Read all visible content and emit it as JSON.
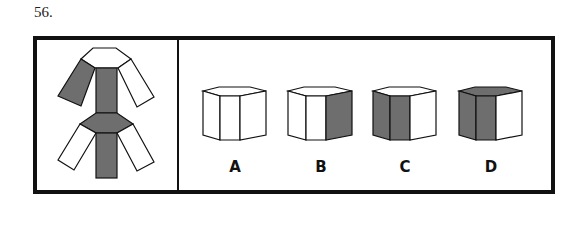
{
  "question": {
    "number": "56."
  },
  "colors": {
    "shaded": "#6e6e6e",
    "line": "#111111",
    "blank": "#ffffff"
  },
  "net": {
    "description": "unfolded hexagonal prism net with shaded faces"
  },
  "options": [
    {
      "label": "A",
      "top": "white",
      "left": "white",
      "mid": "white",
      "right": "white"
    },
    {
      "label": "B",
      "top": "white",
      "left": "white",
      "mid": "white",
      "right": "shaded"
    },
    {
      "label": "C",
      "top": "white",
      "left": "shaded",
      "mid": "shaded",
      "right": "white"
    },
    {
      "label": "D",
      "top": "shaded",
      "left": "shaded",
      "mid": "shaded",
      "right": "white"
    }
  ]
}
